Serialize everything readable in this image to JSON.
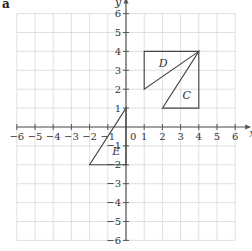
{
  "part_label": "a",
  "axes": {
    "x_label": "x",
    "y_label": "y",
    "x_range": [
      -6,
      6
    ],
    "y_range": [
      -6,
      6
    ],
    "x_ticks": [
      "−6",
      "−5",
      "−4",
      "−3",
      "−2",
      "−1",
      "1",
      "2",
      "3",
      "4",
      "5",
      "6"
    ],
    "y_ticks": [
      "6",
      "5",
      "4",
      "3",
      "2",
      "1",
      "−1",
      "−2",
      "−3",
      "−4",
      "−5",
      "−6"
    ],
    "origin_label": "0",
    "grid": true
  },
  "shapes": [
    {
      "label": "D",
      "vertices": [
        [
          1,
          4
        ],
        [
          4,
          4
        ],
        [
          1,
          2
        ]
      ],
      "label_pos": [
        1.8,
        3.2
      ]
    },
    {
      "label": "C",
      "vertices": [
        [
          4,
          4
        ],
        [
          4,
          1
        ],
        [
          2,
          1
        ]
      ],
      "label_pos": [
        3.1,
        1.5
      ]
    },
    {
      "label": "E",
      "vertices": [
        [
          0,
          1
        ],
        [
          -2,
          -2
        ],
        [
          0,
          -2
        ]
      ],
      "label_pos": [
        -0.75,
        -1.5
      ]
    }
  ],
  "colors": {
    "grid": "#d8d8d8",
    "axis": "#555555",
    "shape_stroke": "#444444"
  }
}
